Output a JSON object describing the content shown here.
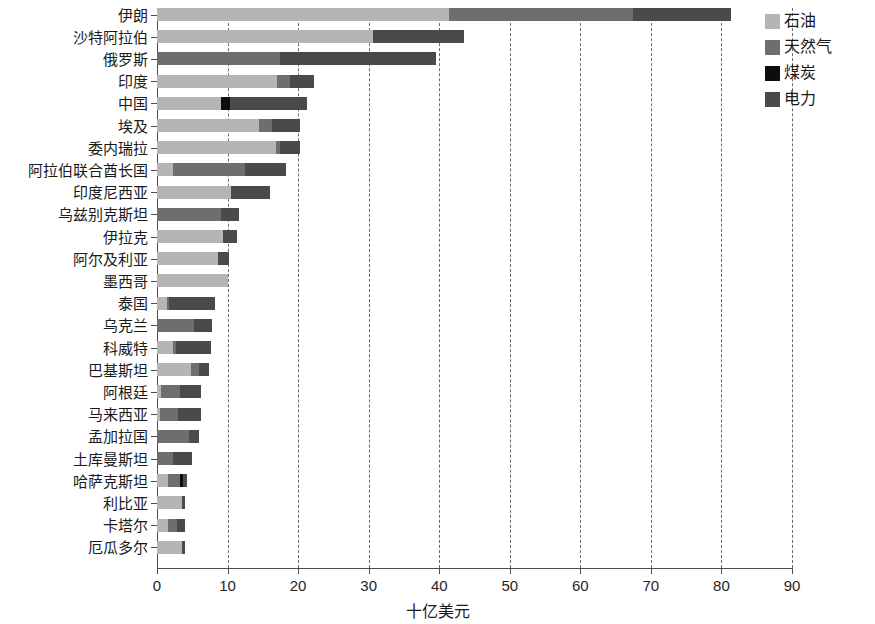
{
  "chart_data": {
    "type": "bar",
    "orientation": "horizontal",
    "stacked": true,
    "title": "",
    "xlabel": "十亿美元",
    "ylabel": "",
    "xlim": [
      0,
      90
    ],
    "xticks": [
      0,
      10,
      20,
      30,
      40,
      50,
      60,
      70,
      80,
      90
    ],
    "grid": "vertical-dashed",
    "legend_position": "right-top",
    "series": [
      {
        "name": "石油",
        "key": "oil",
        "color": "#b5b5b5",
        "values": [
          41.4,
          30.6,
          0,
          17.0,
          9.0,
          14.5,
          16.8,
          2.3,
          10.5,
          0,
          9.3,
          8.6,
          10.1,
          1.4,
          0,
          2.3,
          4.8,
          0.5,
          0.4,
          0,
          0,
          1.6,
          3.5,
          1.5,
          3.5
        ]
      },
      {
        "name": "天然气",
        "key": "gas",
        "color": "#6e6e6e",
        "values": [
          26.0,
          0,
          17.5,
          1.8,
          0,
          1.8,
          0.6,
          10.2,
          0,
          9.0,
          0,
          0,
          0,
          0.3,
          5.3,
          0.4,
          1.2,
          2.7,
          2.6,
          4.5,
          2.3,
          1.7,
          0,
          1.3,
          0
        ]
      },
      {
        "name": "煤炭",
        "key": "coal",
        "color": "#0d0d0d",
        "values": [
          0,
          0,
          0,
          0,
          1.3,
          0,
          0,
          0,
          0,
          0,
          0,
          0,
          0,
          0,
          0,
          0,
          0,
          0,
          0,
          0,
          0,
          0.4,
          0,
          0,
          0
        ]
      },
      {
        "name": "电力",
        "key": "power",
        "color": "#4a4a4a",
        "values": [
          14.0,
          12.9,
          22.0,
          3.4,
          11.0,
          4.0,
          2.8,
          5.8,
          5.5,
          2.6,
          2.0,
          1.6,
          0,
          6.5,
          2.5,
          5.0,
          1.3,
          3.1,
          3.2,
          1.4,
          2.7,
          0.5,
          0.5,
          1.2,
          0.5
        ]
      }
    ],
    "categories": [
      "伊朗",
      "沙特阿拉伯",
      "俄罗斯",
      "印度",
      "中国",
      "埃及",
      "委内瑞拉",
      "阿拉伯联合酋长国",
      "印度尼西亚",
      "乌兹别克斯坦",
      "伊拉克",
      "阿尔及利亚",
      "墨西哥",
      "泰国",
      "乌克兰",
      "科威特",
      "巴基斯坦",
      "阿根廷",
      "马来西亚",
      "孟加拉国",
      "土库曼斯坦",
      "哈萨克斯坦",
      "利比亚",
      "卡塔尔",
      "厄瓜多尔"
    ],
    "totals": [
      81.4,
      43.5,
      39.5,
      22.2,
      21.3,
      20.3,
      20.2,
      18.3,
      16.0,
      11.6,
      11.3,
      10.2,
      10.1,
      8.2,
      7.8,
      7.7,
      7.3,
      6.3,
      6.2,
      5.9,
      5.0,
      4.2,
      4.0,
      4.0,
      4.0
    ]
  },
  "legend": {
    "items": [
      {
        "label": "石油",
        "color": "#b5b5b5"
      },
      {
        "label": "天然气",
        "color": "#6e6e6e"
      },
      {
        "label": "煤炭",
        "color": "#0d0d0d"
      },
      {
        "label": "电力",
        "color": "#4a4a4a"
      }
    ]
  },
  "axis": {
    "x_title": "十亿美元",
    "x_tick_labels": [
      "0",
      "10",
      "20",
      "30",
      "40",
      "50",
      "60",
      "70",
      "80",
      "90"
    ]
  }
}
